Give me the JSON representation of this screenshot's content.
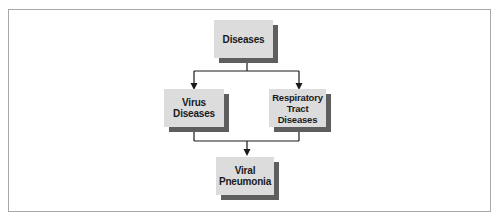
{
  "diagram": {
    "type": "flowchart",
    "nodes": [
      {
        "id": "diseases",
        "label": "Diseases"
      },
      {
        "id": "virus",
        "label": "Virus Diseases",
        "lines": [
          "Virus",
          "Diseases"
        ]
      },
      {
        "id": "respiratory",
        "label": "Respiratory Tract Diseases",
        "lines": [
          "Respiratory",
          "Tract",
          "Diseases"
        ]
      },
      {
        "id": "viral",
        "label": "Viral Pneumonia",
        "lines": [
          "Viral",
          "Pneumonia"
        ]
      }
    ],
    "edges": [
      {
        "from": "diseases",
        "to": "virus"
      },
      {
        "from": "diseases",
        "to": "respiratory"
      },
      {
        "from": "virus",
        "to": "viral"
      },
      {
        "from": "respiratory",
        "to": "viral"
      }
    ],
    "colors": {
      "box_fill": "#dcdcdc",
      "box_shadow": "#5e5e5e",
      "line": "#1a1a1a",
      "frame_border": "#a8a8a8"
    }
  }
}
